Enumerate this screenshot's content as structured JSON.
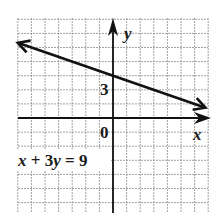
{
  "chart_data": {
    "type": "line",
    "title": "",
    "equation": "x + 3y = 9",
    "xlabel": "x",
    "ylabel": "y",
    "xlim": [
      -7,
      7
    ],
    "ylim": [
      -7,
      7
    ],
    "grid": true,
    "grid_step": 1,
    "tick_labels": [
      {
        "axis": "y",
        "value": 3,
        "label": "3"
      },
      {
        "axis": "origin",
        "value": 0,
        "label": "0"
      }
    ],
    "series": [
      {
        "name": "x + 3y = 9",
        "points": [
          [
            -7,
            5.333
          ],
          [
            6.8,
            0.733
          ]
        ],
        "slope": -0.3333,
        "intercept": 3,
        "arrows": "both"
      }
    ]
  },
  "labels": {
    "x_axis": "x",
    "y_axis": "y",
    "tick_3": "3",
    "origin": "0",
    "equation_lhs": "x + 3",
    "equation_y": "y",
    "equation_rhs": " = 9"
  },
  "colors": {
    "grid": "#8a8a8a",
    "axis": "#111111",
    "line": "#111111",
    "background": "#ffffff"
  }
}
